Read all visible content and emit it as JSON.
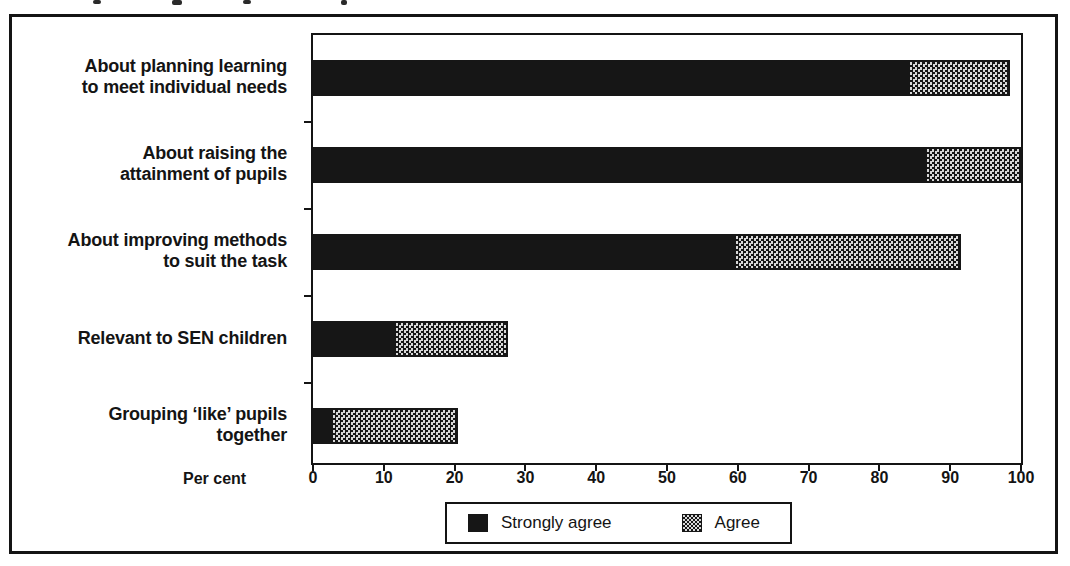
{
  "figure": {
    "background": "#ffffff",
    "ink_color": "#141414",
    "agree_pattern_light": "#d8d8d8"
  },
  "chart_data": {
    "type": "bar",
    "orientation": "horizontal",
    "stacked": true,
    "title": "",
    "categories": [
      "About planning learning\nto meet individual needs",
      "About raising the\nattainment of pupils",
      "About improving methods\nto suit the task",
      "Relevant to SEN children",
      "Grouping ‘like’ pupils\ntogether"
    ],
    "series": [
      {
        "name": "Strongly agree",
        "values": [
          84,
          86.5,
          59.5,
          11.5,
          2.5
        ],
        "color": "#161616",
        "pattern": "solid"
      },
      {
        "name": "Agree",
        "values": [
          14.5,
          13.5,
          32,
          16,
          18
        ],
        "color": "#bdbdbd",
        "pattern": "checker"
      }
    ],
    "totals": [
      98.5,
      100,
      91.5,
      27.5,
      20.5
    ],
    "xlabel": "Per cent",
    "x_ticks": [
      0,
      10,
      20,
      30,
      40,
      50,
      60,
      70,
      80,
      90,
      100
    ],
    "xlim": [
      0,
      100
    ],
    "grid": false,
    "legend_position": "bottom"
  }
}
